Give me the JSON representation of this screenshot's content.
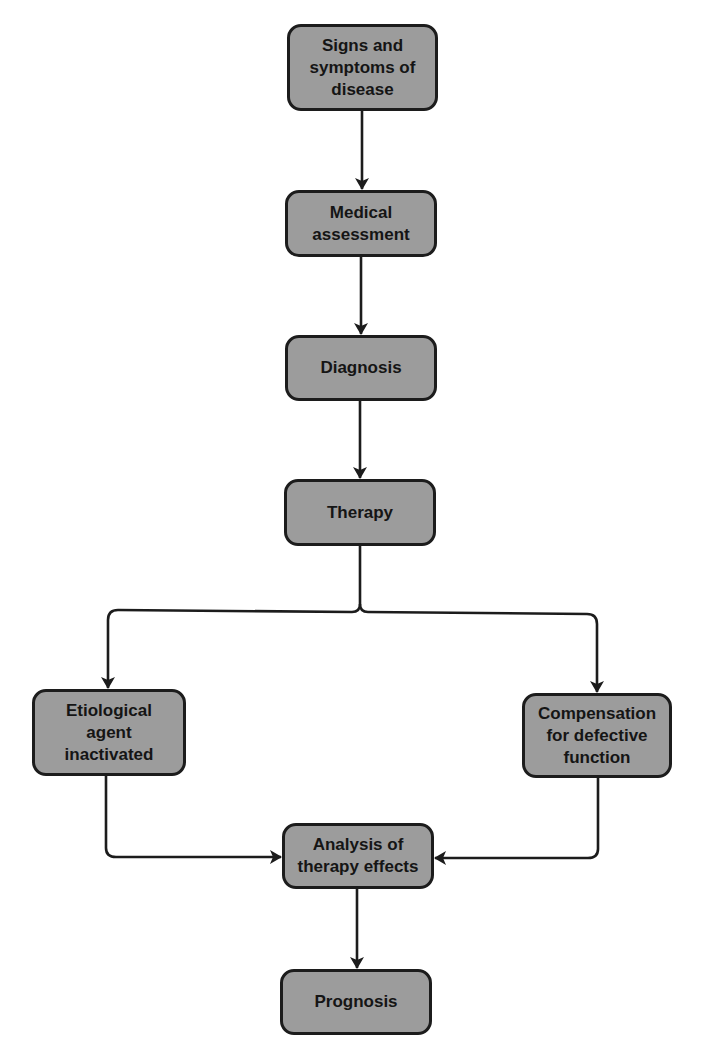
{
  "diagram": {
    "nodes": [
      {
        "id": "signs",
        "label": "Signs and\nsymptoms of\ndisease"
      },
      {
        "id": "assessment",
        "label": "Medical\nassessment"
      },
      {
        "id": "diagnosis",
        "label": "Diagnosis"
      },
      {
        "id": "therapy",
        "label": "Therapy"
      },
      {
        "id": "etiological",
        "label": "Etiological\nagent\ninactivated"
      },
      {
        "id": "compensation",
        "label": "Compensation\nfor defective\nfunction"
      },
      {
        "id": "analysis",
        "label": "Analysis of\ntherapy effects"
      },
      {
        "id": "prognosis",
        "label": "Prognosis"
      }
    ],
    "edges": [
      {
        "from": "signs",
        "to": "assessment"
      },
      {
        "from": "assessment",
        "to": "diagnosis"
      },
      {
        "from": "diagnosis",
        "to": "therapy"
      },
      {
        "from": "therapy",
        "to": "etiological"
      },
      {
        "from": "therapy",
        "to": "compensation"
      },
      {
        "from": "etiological",
        "to": "analysis"
      },
      {
        "from": "compensation",
        "to": "analysis"
      },
      {
        "from": "analysis",
        "to": "prognosis"
      }
    ],
    "colors": {
      "node_fill": "#9c9c9c",
      "node_border": "#1c1c1c",
      "line": "#1c1c1c",
      "background": "#ffffff"
    }
  }
}
